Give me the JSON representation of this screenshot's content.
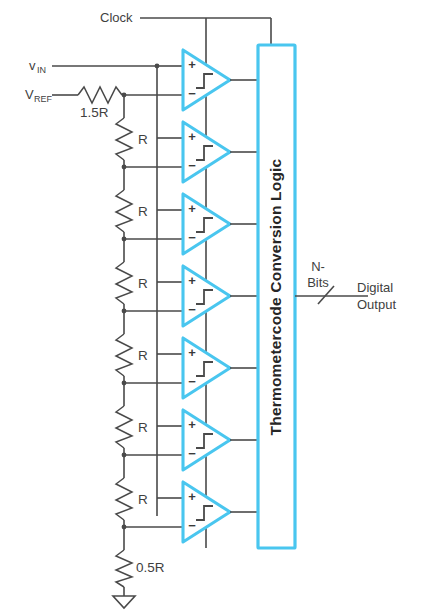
{
  "diagram": {
    "colors": {
      "comparator_outline": "#49c6ef",
      "logic_block_outline": "#49c6ef",
      "wire": "#4a4a4a",
      "text": "#3f3f3f",
      "background": "#ffffff"
    },
    "signals": {
      "clock_label": "Clock",
      "vin_label": "v",
      "vin_subscript": "IN",
      "vref_label": "V",
      "vref_subscript": "REF"
    },
    "resistors": [
      {
        "id": "r-top",
        "label": "1.5R",
        "orientation": "horizontal"
      },
      {
        "id": "r-ladder-1",
        "label": "R",
        "orientation": "vertical"
      },
      {
        "id": "r-ladder-2",
        "label": "R",
        "orientation": "vertical"
      },
      {
        "id": "r-ladder-3",
        "label": "R",
        "orientation": "vertical"
      },
      {
        "id": "r-ladder-4",
        "label": "R",
        "orientation": "vertical"
      },
      {
        "id": "r-ladder-5",
        "label": "R",
        "orientation": "vertical"
      },
      {
        "id": "r-ladder-6",
        "label": "R",
        "orientation": "vertical"
      },
      {
        "id": "r-bottom",
        "label": "0.5R",
        "orientation": "vertical"
      }
    ],
    "comparators": [
      {
        "id": "comparator-1",
        "plus": "+",
        "minus": "−"
      },
      {
        "id": "comparator-2",
        "plus": "+",
        "minus": "−"
      },
      {
        "id": "comparator-3",
        "plus": "+",
        "minus": "−"
      },
      {
        "id": "comparator-4",
        "plus": "+",
        "minus": "−"
      },
      {
        "id": "comparator-5",
        "plus": "+",
        "minus": "−"
      },
      {
        "id": "comparator-6",
        "plus": "+",
        "minus": "−"
      },
      {
        "id": "comparator-7",
        "plus": "+",
        "minus": "−"
      }
    ],
    "logic_block": {
      "label": "Thermometercode Conversion Logic",
      "orientation": "vertical-text"
    },
    "output": {
      "bus_label_line1": "N-",
      "bus_label_line2": "Bits",
      "name_line1": "Digital",
      "name_line2": "Output"
    },
    "ground": {
      "symbol": "ground-triangle"
    }
  }
}
